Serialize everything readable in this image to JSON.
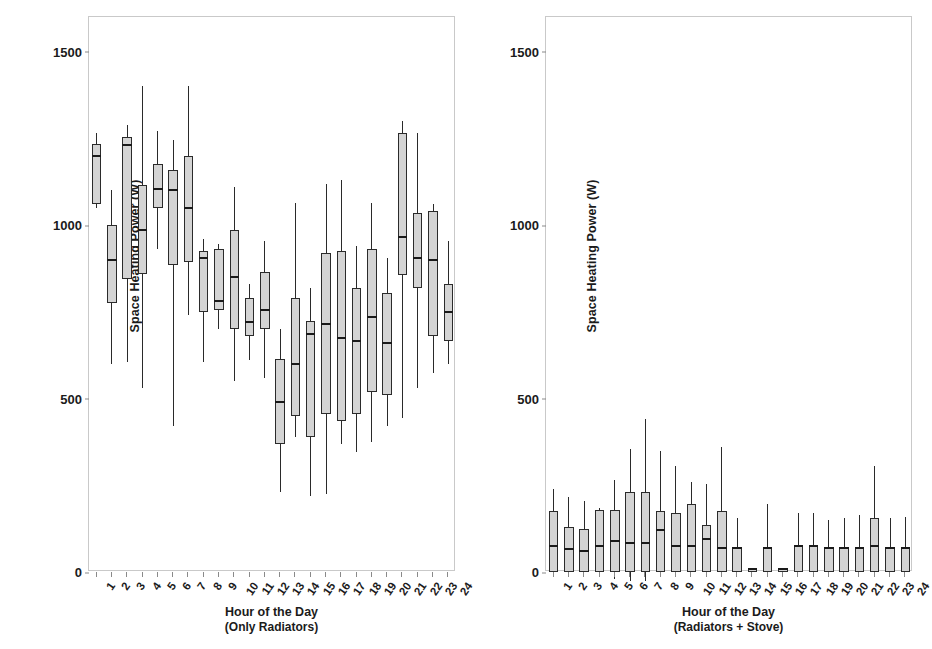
{
  "figure": {
    "panels": [
      {
        "id": "only-radiators",
        "y_title": "Space Heating Power (W)",
        "x_title": "Hour of the Day",
        "x_subtitle": "(Only Radiators)"
      },
      {
        "id": "radiators-plus-stove",
        "y_title": "Space Heating Power (W)",
        "x_title": "Hour of the Day",
        "x_subtitle": "(Radiators + Stove)"
      }
    ]
  },
  "chart_data": [
    {
      "type": "box",
      "title": "",
      "xlabel": "Hour of the Day (Only Radiators)",
      "ylabel": "Space Heating Power (W)",
      "ylim": [
        0,
        1600
      ],
      "yticks": [
        0,
        500,
        1000,
        1500
      ],
      "ytick_labels": [
        "0",
        "500",
        "1000",
        "1500"
      ],
      "grid": false,
      "legend": "none",
      "categories": [
        "1",
        "2",
        "3",
        "4",
        "5",
        "6",
        "7",
        "8",
        "9",
        "10",
        "11",
        "12",
        "13",
        "14",
        "15",
        "16",
        "17",
        "18",
        "19",
        "20",
        "21",
        "22",
        "23",
        "24"
      ],
      "boxes": [
        {
          "x": "1",
          "whislo": 1050,
          "q1": 1060,
          "med": 1200,
          "q3": 1235,
          "whishi": 1265
        },
        {
          "x": "2",
          "whislo": 600,
          "q1": 775,
          "med": 900,
          "q3": 1000,
          "whishi": 1100
        },
        {
          "x": "3",
          "whislo": 605,
          "q1": 845,
          "med": 1230,
          "q3": 1255,
          "whishi": 1290
        },
        {
          "x": "4",
          "whislo": 530,
          "q1": 860,
          "med": 985,
          "q3": 1115,
          "whishi": 1400
        },
        {
          "x": "5",
          "whislo": 930,
          "q1": 1050,
          "med": 1105,
          "q3": 1175,
          "whishi": 1270
        },
        {
          "x": "6",
          "whislo": 420,
          "q1": 885,
          "med": 1100,
          "q3": 1160,
          "whishi": 1245
        },
        {
          "x": "7",
          "whislo": 740,
          "q1": 895,
          "med": 1050,
          "q3": 1200,
          "whishi": 1400
        },
        {
          "x": "8",
          "whislo": 605,
          "q1": 750,
          "med": 905,
          "q3": 925,
          "whishi": 960
        },
        {
          "x": "9",
          "whislo": 700,
          "q1": 755,
          "med": 780,
          "q3": 930,
          "whishi": 945
        },
        {
          "x": "10",
          "whislo": 550,
          "q1": 700,
          "med": 850,
          "q3": 985,
          "whishi": 1110
        },
        {
          "x": "11",
          "whislo": 610,
          "q1": 680,
          "med": 720,
          "q3": 790,
          "whishi": 830
        },
        {
          "x": "12",
          "whislo": 560,
          "q1": 700,
          "med": 755,
          "q3": 865,
          "whishi": 955
        },
        {
          "x": "13",
          "whislo": 230,
          "q1": 370,
          "med": 490,
          "q3": 615,
          "whishi": 700
        },
        {
          "x": "14",
          "whislo": 390,
          "q1": 450,
          "med": 600,
          "q3": 790,
          "whishi": 1065
        },
        {
          "x": "15",
          "whislo": 220,
          "q1": 390,
          "med": 685,
          "q3": 725,
          "whishi": 820
        },
        {
          "x": "16",
          "whislo": 225,
          "q1": 455,
          "med": 715,
          "q3": 920,
          "whishi": 1120
        },
        {
          "x": "17",
          "whislo": 370,
          "q1": 435,
          "med": 675,
          "q3": 925,
          "whishi": 1130
        },
        {
          "x": "18",
          "whislo": 345,
          "q1": 455,
          "med": 665,
          "q3": 820,
          "whishi": 940
        },
        {
          "x": "19",
          "whislo": 375,
          "q1": 520,
          "med": 735,
          "q3": 930,
          "whishi": 1065
        },
        {
          "x": "20",
          "whislo": 420,
          "q1": 510,
          "med": 660,
          "q3": 805,
          "whishi": 905
        },
        {
          "x": "21",
          "whislo": 445,
          "q1": 855,
          "med": 965,
          "q3": 1265,
          "whishi": 1300
        },
        {
          "x": "22",
          "whislo": 530,
          "q1": 820,
          "med": 905,
          "q3": 1035,
          "whishi": 1265
        },
        {
          "x": "23",
          "whislo": 575,
          "q1": 680,
          "med": 900,
          "q3": 1040,
          "whishi": 1060
        },
        {
          "x": "24",
          "whislo": 600,
          "q1": 665,
          "med": 750,
          "q3": 830,
          "whishi": 955
        }
      ]
    },
    {
      "type": "box",
      "title": "",
      "xlabel": "Hour of the Day (Radiators + Stove)",
      "ylabel": "Space Heating Power (W)",
      "ylim": [
        0,
        1600
      ],
      "yticks": [
        0,
        500,
        1000,
        1500
      ],
      "ytick_labels": [
        "0",
        "500",
        "1000",
        "1500"
      ],
      "grid": false,
      "legend": "none",
      "categories": [
        "1",
        "2",
        "3",
        "4",
        "5",
        "6",
        "7",
        "8",
        "9",
        "10",
        "11",
        "12",
        "13",
        "14",
        "15",
        "16",
        "17",
        "18",
        "19",
        "20",
        "21",
        "22",
        "23",
        "24"
      ],
      "boxes": [
        {
          "x": "1",
          "whislo": 0,
          "q1": 0,
          "med": 75,
          "q3": 175,
          "whishi": 240
        },
        {
          "x": "2",
          "whislo": 0,
          "q1": 0,
          "med": 65,
          "q3": 130,
          "whishi": 215
        },
        {
          "x": "3",
          "whislo": 0,
          "q1": 0,
          "med": 60,
          "q3": 125,
          "whishi": 205
        },
        {
          "x": "4",
          "whislo": 0,
          "q1": 0,
          "med": 75,
          "q3": 180,
          "whishi": 185
        },
        {
          "x": "5",
          "whislo": -20,
          "q1": 0,
          "med": 90,
          "q3": 180,
          "whishi": 265
        },
        {
          "x": "6",
          "whislo": -25,
          "q1": 0,
          "med": 85,
          "q3": 230,
          "whishi": 355
        },
        {
          "x": "7",
          "whislo": -25,
          "q1": 0,
          "med": 85,
          "q3": 230,
          "whishi": 440
        },
        {
          "x": "8",
          "whislo": 0,
          "q1": 0,
          "med": 120,
          "q3": 175,
          "whishi": 350
        },
        {
          "x": "9",
          "whislo": 0,
          "q1": 0,
          "med": 75,
          "q3": 170,
          "whishi": 305
        },
        {
          "x": "10",
          "whislo": 0,
          "q1": 0,
          "med": 75,
          "q3": 195,
          "whishi": 260
        },
        {
          "x": "11",
          "whislo": 0,
          "q1": 0,
          "med": 95,
          "q3": 135,
          "whishi": 255
        },
        {
          "x": "12",
          "whislo": 0,
          "q1": 0,
          "med": 70,
          "q3": 175,
          "whishi": 360
        },
        {
          "x": "13",
          "whislo": 0,
          "q1": 0,
          "med": 70,
          "q3": 70,
          "whishi": 155
        },
        {
          "x": "14",
          "whislo": 0,
          "q1": 0,
          "med": 8,
          "q3": 8,
          "whishi": 8
        },
        {
          "x": "15",
          "whislo": 0,
          "q1": 0,
          "med": 70,
          "q3": 70,
          "whishi": 195
        },
        {
          "x": "16",
          "whislo": 0,
          "q1": 0,
          "med": 8,
          "q3": 8,
          "whishi": 8
        },
        {
          "x": "17",
          "whislo": 0,
          "q1": 0,
          "med": 75,
          "q3": 75,
          "whishi": 170
        },
        {
          "x": "18",
          "whislo": 0,
          "q1": 0,
          "med": 75,
          "q3": 75,
          "whishi": 170
        },
        {
          "x": "19",
          "whislo": 0,
          "q1": 0,
          "med": 70,
          "q3": 70,
          "whishi": 150
        },
        {
          "x": "20",
          "whislo": 0,
          "q1": 0,
          "med": 70,
          "q3": 70,
          "whishi": 155
        },
        {
          "x": "21",
          "whislo": 0,
          "q1": 0,
          "med": 70,
          "q3": 70,
          "whishi": 165
        },
        {
          "x": "22",
          "whislo": 0,
          "q1": 0,
          "med": 75,
          "q3": 155,
          "whishi": 305
        },
        {
          "x": "23",
          "whislo": 0,
          "q1": 0,
          "med": 70,
          "q3": 70,
          "whishi": 155
        },
        {
          "x": "24",
          "whislo": 0,
          "q1": 0,
          "med": 70,
          "q3": 70,
          "whishi": 160
        }
      ]
    }
  ]
}
